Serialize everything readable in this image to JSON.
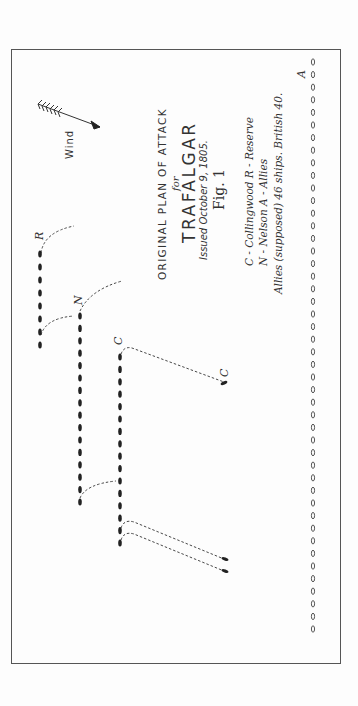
{
  "title": {
    "line1": "ORIGINAL PLAN OF ATTACK",
    "line2": "for",
    "line3": "TRAFALGAR",
    "line4": "Issued October 9, 1805.",
    "line5": "Fig. 1"
  },
  "legend": {
    "line1": "C - Collingwood   R - Reserve",
    "line2": "N - Nelson           A - Allies",
    "line3": "Allies (supposed) 46  ships. British  40."
  },
  "wind": {
    "label": "Wind"
  },
  "labels": {
    "reserve": "R",
    "nelson": "N",
    "collingwood_top": "C",
    "collingwood_detached": "C",
    "allies": "A"
  },
  "fleets": {
    "reserve": {
      "x": 40,
      "y_start": 254,
      "count": 8,
      "spacing": 13
    },
    "nelson": {
      "x": 80,
      "y_start": 316,
      "count": 16,
      "spacing": 12.4
    },
    "collingwood": {
      "x": 120,
      "y_start": 357,
      "count": 16,
      "spacing": 12.4
    },
    "allies": {
      "x": 313,
      "y_start": 62,
      "count": 46,
      "spacing": 12.6
    }
  },
  "colors": {
    "ink": "#222222",
    "frame": "#555555",
    "background": "#fdfdfd"
  }
}
